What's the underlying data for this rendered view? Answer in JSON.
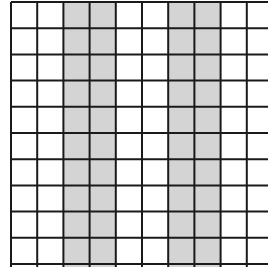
{
  "diagram": {
    "type": "grid",
    "columns_visible": 10,
    "rows_visible": 10,
    "origin_x": 11,
    "origin_y": 2,
    "cell_size": 26.2,
    "line_color": "#1a1a1a",
    "line_width": 2,
    "fill_color": "#ffffff",
    "shade_color": "#d4d4d4",
    "shaded_columns": [
      2,
      3,
      6,
      7
    ]
  }
}
